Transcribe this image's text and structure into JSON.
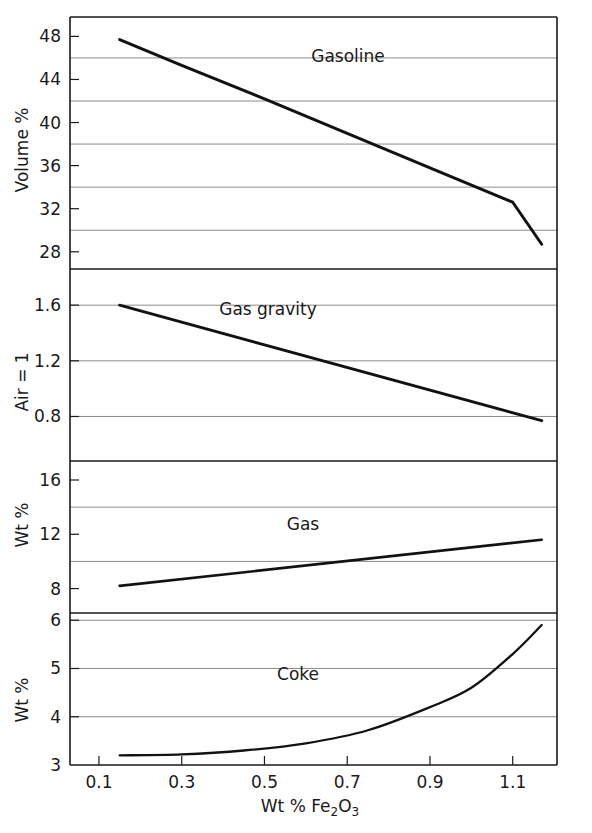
{
  "chart_data": {
    "type": "line",
    "title": "",
    "xlabel": "Wt % Fe2O3",
    "xlabel_parts": {
      "prefix": "Wt % Fe",
      "sub1": "2",
      "mid": "O",
      "sub2": "3"
    },
    "xlim": [
      0.03,
      1.207
    ],
    "xticks": [
      0.1,
      0.3,
      0.5,
      0.7,
      0.9,
      1.1
    ],
    "xticklabels": [
      "0.1",
      "0.3",
      "0.5",
      "0.7",
      "0.9",
      "1.1"
    ],
    "grid": true,
    "legend_position": "inline-annotation",
    "panels": [
      {
        "name": "gasoline",
        "ylabel": "Volume %",
        "series_label": "Gasoline",
        "ylim": [
          26.4,
          49.8
        ],
        "yticks": [
          48,
          44,
          40,
          36,
          32,
          28
        ],
        "yticklabels": [
          "48",
          "44",
          "40",
          "36",
          "32",
          "28"
        ],
        "gridvalues": [
          46,
          42,
          38,
          34,
          30
        ],
        "x": [
          0.15,
          0.3,
          0.5,
          0.7,
          0.9,
          1.1,
          1.17
        ],
        "y": [
          47.7,
          45.3,
          42.2,
          39.0,
          35.8,
          32.6,
          28.7
        ],
        "series": [
          {
            "name": "Gasoline",
            "x": [
              0.15,
              1.17
            ],
            "values": [
              47.7,
              28.7
            ]
          }
        ]
      },
      {
        "name": "gas-gravity",
        "ylabel": "Air = 1",
        "series_label": "Gas gravity",
        "ylim": [
          0.48,
          1.86
        ],
        "yticks": [
          1.6,
          1.2,
          0.8
        ],
        "yticklabels": [
          "1.6",
          "1.2",
          "0.8"
        ],
        "gridvalues": [
          1.6,
          1.2,
          0.8
        ],
        "x": [
          0.15,
          1.17
        ],
        "y": [
          1.6,
          0.77
        ],
        "series": [
          {
            "name": "Gas gravity",
            "x": [
              0.15,
              1.17
            ],
            "values": [
              1.6,
              0.77
            ]
          }
        ]
      },
      {
        "name": "gas",
        "ylabel": "Wt %",
        "series_label": "Gas",
        "ylim": [
          6.2,
          17.4
        ],
        "yticks": [
          16,
          12,
          8
        ],
        "yticklabels": [
          "16",
          "12",
          "8"
        ],
        "gridvalues": [
          14,
          10
        ],
        "x": [
          0.15,
          1.17
        ],
        "y": [
          8.2,
          11.6
        ],
        "series": [
          {
            "name": "Gas",
            "x": [
              0.15,
              1.17
            ],
            "values": [
              8.2,
              11.6
            ]
          }
        ]
      },
      {
        "name": "coke",
        "ylabel": "Wt %",
        "series_label": "Coke",
        "ylim": [
          3.0,
          6.15
        ],
        "yticks": [
          6,
          5,
          4,
          3
        ],
        "yticklabels": [
          "6",
          "5",
          "4",
          "3"
        ],
        "gridvalues": [
          6,
          5,
          4
        ],
        "x": [
          0.15,
          0.3,
          0.45,
          0.6,
          0.75,
          0.9,
          1.0,
          1.1,
          1.17
        ],
        "y": [
          3.2,
          3.22,
          3.3,
          3.45,
          3.72,
          4.2,
          4.6,
          5.3,
          5.9
        ],
        "series": [
          {
            "name": "Coke",
            "x": [
              0.15,
              0.3,
              0.45,
              0.6,
              0.75,
              0.9,
              1.0,
              1.1,
              1.17
            ],
            "values": [
              3.2,
              3.22,
              3.3,
              3.45,
              3.72,
              4.2,
              4.6,
              5.3,
              5.9
            ]
          }
        ]
      }
    ]
  },
  "axis": {
    "ylabels": [
      "Volume %",
      "Air = 1",
      "Wt %",
      "Wt %"
    ],
    "series_labels": [
      "Gasoline",
      "Gas gravity",
      "Gas",
      "Coke"
    ],
    "ytick_groups": [
      [
        "48",
        "44",
        "40",
        "36",
        "32",
        "28"
      ],
      [
        "1.6",
        "1.2",
        "0.8"
      ],
      [
        "16",
        "12",
        "8"
      ],
      [
        "6",
        "5",
        "4",
        "3"
      ]
    ],
    "xtick_labels": [
      "0.1",
      "0.3",
      "0.5",
      "0.7",
      "0.9",
      "1.1"
    ],
    "xlabel_prefix": "Wt % Fe",
    "xlabel_sub1": "2",
    "xlabel_mid": "O",
    "xlabel_sub2": "3"
  },
  "colors": {
    "frame": "#1a1a1a",
    "grid": "#808080",
    "line": "#121212",
    "text": "#1a1a1a",
    "background": "#ffffff"
  }
}
